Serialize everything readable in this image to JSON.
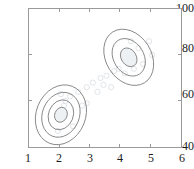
{
  "chart_data": {
    "type": "scatter",
    "title": "",
    "xlabel": "",
    "ylabel": "",
    "xlim": [
      1,
      6
    ],
    "ylim": [
      40,
      100
    ],
    "xticks": [
      1,
      2,
      3,
      4,
      5,
      6
    ],
    "yticks": [
      40,
      60,
      80,
      100
    ],
    "xtick_labels": [
      "1",
      "2",
      "3",
      "4",
      "5",
      "6"
    ],
    "ytick_labels": [
      "40",
      "60",
      "80",
      "100"
    ],
    "grid": false,
    "legend": null,
    "frame_color": "#9a9a9a",
    "contour_color": "#7a7a7a",
    "fill_color": "#eef1f3",
    "point_color": "#d8dde2",
    "series": [
      {
        "name": "cluster-1",
        "kind": "gaussian-contour",
        "center_x": 2.05,
        "center_y": 54,
        "sigma_x": 0.28,
        "sigma_y": 4.6,
        "rotation_deg": 22,
        "levels": 4
      },
      {
        "name": "cluster-2",
        "kind": "gaussian-contour",
        "center_x": 4.28,
        "center_y": 79,
        "sigma_x": 0.34,
        "sigma_y": 3.4,
        "rotation_deg": 58,
        "levels": 3
      }
    ],
    "scatter_points": [
      [
        2.35,
        62
      ],
      [
        2.62,
        64
      ],
      [
        2.9,
        66
      ],
      [
        3.1,
        68
      ],
      [
        3.35,
        70
      ],
      [
        3.55,
        71
      ],
      [
        2.2,
        60
      ],
      [
        3.8,
        73
      ],
      [
        2.75,
        58
      ],
      [
        3.25,
        64
      ],
      [
        1.95,
        47
      ],
      [
        2.45,
        49
      ],
      [
        4.6,
        83
      ],
      [
        4.95,
        86
      ],
      [
        4.35,
        86
      ],
      [
        3.95,
        74
      ],
      [
        4.15,
        72
      ],
      [
        4.75,
        76
      ],
      [
        2.15,
        58
      ],
      [
        3.45,
        67
      ],
      [
        2.05,
        63
      ],
      [
        2.9,
        59
      ],
      [
        3.7,
        66
      ],
      [
        4.45,
        74
      ],
      [
        5.05,
        80
      ]
    ]
  }
}
